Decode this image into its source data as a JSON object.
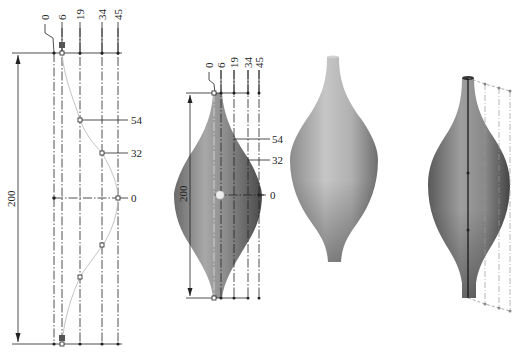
{
  "figure": {
    "panels": [
      {
        "id": "profile-sketch",
        "description": "2D sketch of revolve profile with spline through control points",
        "column_labels": [
          "0",
          "6",
          "19",
          "34",
          "45"
        ],
        "row_labels": [
          "54",
          "32",
          "0"
        ],
        "height_dimension": "200"
      },
      {
        "id": "revolved-sketch-overlay",
        "description": "Revolved solid with sketch overlay",
        "column_labels": [
          "0",
          "6",
          "19",
          "34",
          "45"
        ],
        "row_labels": [
          "54",
          "32",
          "0"
        ],
        "height_dimension": "200"
      },
      {
        "id": "shaded-solid",
        "description": "Shaded 3D revolved vase solid"
      },
      {
        "id": "shaded-solid-with-profile",
        "description": "Shaded solid with axis and profile construction lines"
      }
    ],
    "colors": {
      "line": "#222222",
      "spline": "#bbbbbb",
      "solid_light": "#c8c8c8",
      "solid_mid": "#9a9a9a",
      "solid_dark": "#555555"
    }
  }
}
